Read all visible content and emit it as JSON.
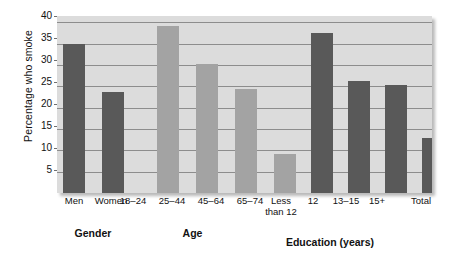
{
  "chart_data": {
    "type": "bar",
    "title": "",
    "xlabel": "",
    "ylabel": "Percentage who smoke",
    "ylim": [
      0,
      41.5
    ],
    "yticks": [
      5,
      10,
      15,
      20,
      25,
      30,
      35,
      40
    ],
    "grid": true,
    "legend": "none",
    "categories": [
      "Men",
      "Women",
      "18–24",
      "25–44",
      "45–64",
      "65–74",
      "Less than 12",
      "12",
      "13–15",
      "15+",
      "Total"
    ],
    "values": [
      35.0,
      23.8,
      39.1,
      30.2,
      24.3,
      9.1,
      37.6,
      26.2,
      25.3,
      12.8,
      29.4
    ],
    "bar_colors": [
      "#595959",
      "#595959",
      "#a3a3a3",
      "#a3a3a3",
      "#a3a3a3",
      "#a3a3a3",
      "#595959",
      "#595959",
      "#595959",
      "#595959",
      "#595959"
    ],
    "groups": [
      {
        "label": "Gender",
        "categories": [
          "Men",
          "Women"
        ]
      },
      {
        "label": "Age",
        "categories": [
          "18–24",
          "25–44",
          "45–64",
          "65–74"
        ]
      },
      {
        "label": "Education (years)",
        "categories": [
          "Less than 12",
          "12",
          "13–15",
          "15+"
        ]
      },
      {
        "label": "",
        "categories": [
          "Total"
        ]
      }
    ],
    "plot_background": "#dcdcdc",
    "gridline_color": "#8d8d8d"
  },
  "axis": {
    "y_title": "Percentage who smoke",
    "y_tick_labels": [
      "40",
      "35",
      "30",
      "25",
      "20",
      "15",
      "10",
      "5"
    ]
  },
  "x_labels": {
    "men": "Men",
    "women": "Women",
    "age_18_24": "18–24",
    "age_25_44": "25–44",
    "age_45_64": "45–64",
    "age_65_74": "65–74",
    "edu_less_12_line1": "Less",
    "edu_less_12_line2": "than 12",
    "edu_12": "12",
    "edu_13_15": "13–15",
    "edu_15plus": "15+",
    "total": "Total"
  },
  "group_labels": {
    "gender": "Gender",
    "age": "Age",
    "education": "Education (years)"
  }
}
